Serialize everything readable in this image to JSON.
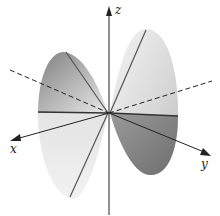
{
  "figure": {
    "axes": {
      "x_label": "x",
      "y_label": "y",
      "z_label": "z"
    },
    "colors": {
      "surface_light": "#e6e6e6",
      "surface_dark": "#8c8c8c",
      "line": "#333333",
      "axis": "#222222"
    }
  }
}
